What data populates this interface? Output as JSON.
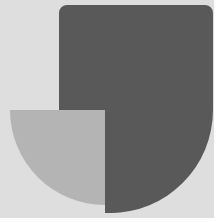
{
  "artwork": {
    "title": "Abstract geometric logo mark",
    "width": 218,
    "height": 222,
    "background_color": "#ffffff",
    "canvas_color": "#dedede",
    "shape_colors": {
      "light_gray": "#dedede",
      "medium_gray": "#b4b4b4",
      "dark_gray": "#595959",
      "white_margin": "#ffffff"
    },
    "circle": {
      "center_x": 105,
      "center_y": 110,
      "radius": 103
    },
    "shapes": [
      {
        "name": "background-plate",
        "kind": "rectangle",
        "color": "#dedede",
        "x": 0,
        "y": 0,
        "width": 214,
        "height": 218
      },
      {
        "name": "medium-gray-quarter-disc",
        "kind": "quarter-circle",
        "color": "#b4b4b4",
        "quadrant": "bottom-left",
        "center_x": 105,
        "center_y": 110,
        "radius": 95
      },
      {
        "name": "dark-gray-mark",
        "kind": "compound",
        "color": "#595959",
        "description": "rectangle from x=59,y=5 to x=213,y=110 joined with the right and bottom portion of the disc",
        "rect_x": 59,
        "rect_y": 5,
        "rect_width": 154,
        "rect_height": 105,
        "corner_radius": 8
      }
    ]
  }
}
